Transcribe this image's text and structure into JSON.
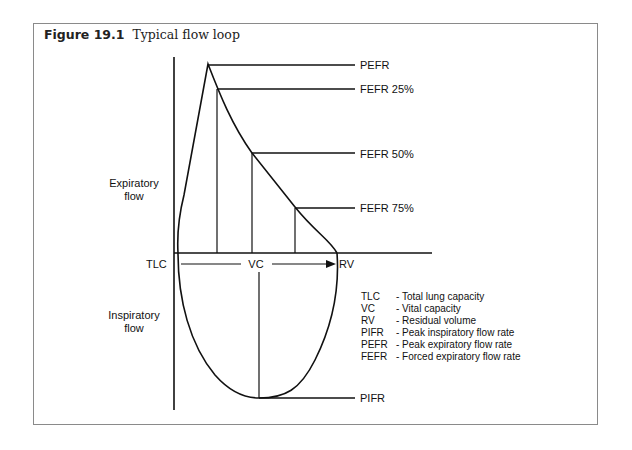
{
  "figure": {
    "number": "Figure 19.1",
    "caption": "Typical flow loop"
  },
  "axes": {
    "y_upper_label_line1": "Expiratory",
    "y_upper_label_line2": "flow",
    "y_lower_label_line1": "Inspiratory",
    "y_lower_label_line2": "flow",
    "x_left_label": "TLC",
    "x_right_label": "RV",
    "span_label": "VC"
  },
  "markers": {
    "pefr": "PEFR",
    "fefr25": "FEFR 25%",
    "fefr50": "FEFR 50%",
    "fefr75": "FEFR 75%",
    "pifr": "PIFR"
  },
  "legend": [
    {
      "abbr": "TLC",
      "desc": "- Total lung capacity"
    },
    {
      "abbr": "VC",
      "desc": "- Vital capacity"
    },
    {
      "abbr": "RV",
      "desc": "- Residual volume"
    },
    {
      "abbr": "PIFR",
      "desc": "- Peak inspiratory flow rate"
    },
    {
      "abbr": "PEFR",
      "desc": "- Peak expiratory flow rate"
    },
    {
      "abbr": "FEFR",
      "desc": "- Forced expiratory flow rate"
    }
  ]
}
